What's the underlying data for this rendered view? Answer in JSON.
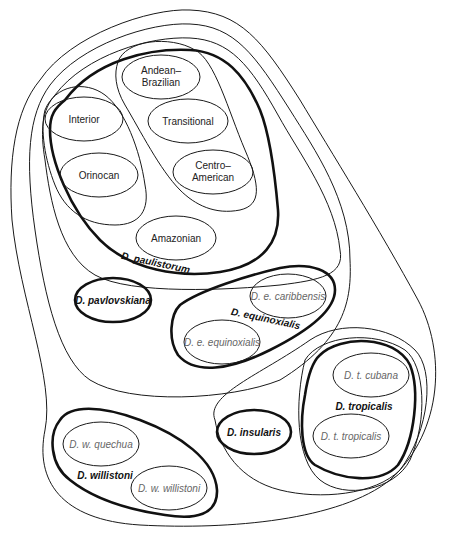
{
  "diagram": {
    "type": "nested-set-diagram",
    "colors": {
      "stroke": "#111111",
      "semispecies_text": "#222222",
      "subspecies_text": "#666666",
      "background": "#ffffff"
    },
    "semispecies": {
      "andean_brazilian": [
        "Andean–",
        "Brazilian"
      ],
      "interior": "Interior",
      "transitional": "Transitional",
      "orinocan": "Orinocan",
      "centro_american": [
        "Centro–",
        "American"
      ],
      "amazonian": "Amazonian"
    },
    "species": {
      "paulistorum": "D. paulistorum",
      "pavlovskiana": "D. pavlovskiana",
      "equinoxialis": "D. equinoxialis",
      "insularis": "D. insularis",
      "tropicalis": "D. tropicalis",
      "willistoni": "D. willistoni"
    },
    "subspecies": {
      "e_caribbensis": "D. e. caribbensis",
      "e_equinoxialis": "D. e. equinoxialis",
      "t_cubana": "D. t. cubana",
      "t_tropicalis": "D. t. tropicalis",
      "w_quechua": "D. w. quechua",
      "w_willistoni": "D. w. willistoni"
    }
  }
}
